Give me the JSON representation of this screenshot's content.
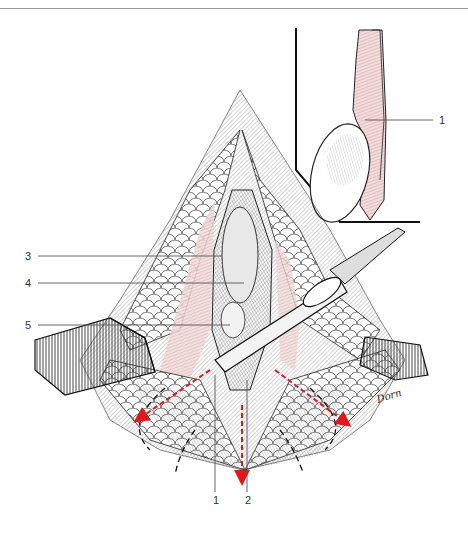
{
  "figure": {
    "type": "surgical-illustration",
    "signature": "Dorn",
    "colors": {
      "line": "#1a1a1a",
      "tissue_pink": "#d9a7a7",
      "arrow_red": "#e01818",
      "leader": "#555555",
      "label": "#333333"
    }
  },
  "labels": {
    "left": [
      {
        "id": "3",
        "text": "3"
      },
      {
        "id": "4",
        "text": "4"
      },
      {
        "id": "5",
        "text": "5"
      }
    ],
    "bottom": [
      {
        "id": "1",
        "text": "1"
      },
      {
        "id": "2",
        "text": "2"
      }
    ],
    "inset": [
      {
        "id": "1",
        "text": "1"
      }
    ]
  },
  "annotations": {
    "arrows": [
      "left-lateral-incision",
      "midline-incision",
      "right-lateral-incision"
    ],
    "dashed_lines": [
      "left-curved-dashed",
      "right-curved-dashed"
    ]
  }
}
